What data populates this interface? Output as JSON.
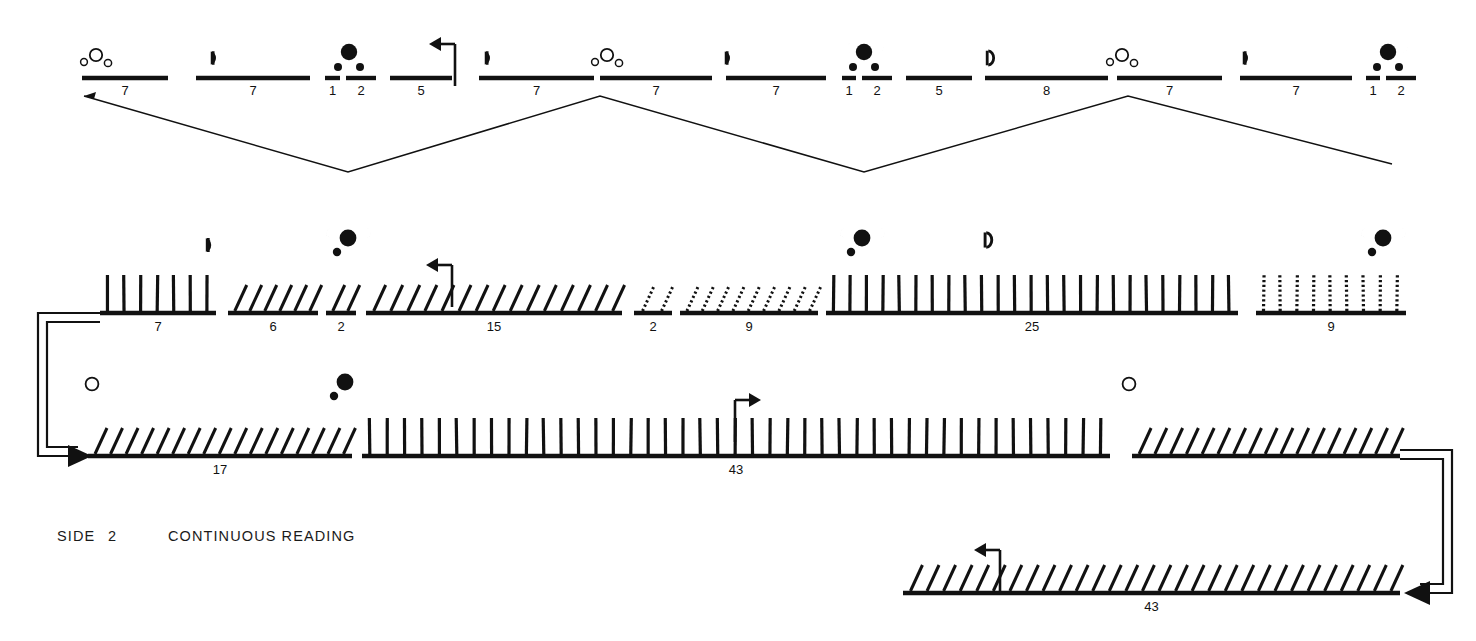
{
  "caption": {
    "side_label": "SIDE",
    "side_number": "2",
    "reading_label": "CONTINUOUS READING"
  },
  "colors": {
    "ink": "#111111",
    "paper": "#ffffff"
  },
  "glyph_legend": {
    "open_circle": "new-moon-open-circle",
    "filled_disc": "full-moon-filled-disc",
    "left_crescent": "waning-crescent",
    "right_crescent": "waxing-crescent",
    "half_left": "last-quarter-half-moon",
    "half_right": "first-quarter-half-moon",
    "flag_arrow": "turn-direction-marker"
  },
  "rows": [
    {
      "id": "row-1",
      "name": "top-segment-row",
      "style": "plain-bars",
      "y": 78,
      "segments": [
        {
          "count": "7",
          "x1": 82,
          "x2": 168
        },
        {
          "count": "7",
          "x1": 196,
          "x2": 310
        },
        {
          "count": "1",
          "x1": 325,
          "x2": 340
        },
        {
          "count": "2",
          "x1": 346,
          "x2": 376
        },
        {
          "count": "5",
          "x1": 390,
          "x2": 452
        },
        {
          "count": "7",
          "x1": 479,
          "x2": 594
        },
        {
          "count": "7",
          "x1": 600,
          "x2": 712
        },
        {
          "count": "7",
          "x1": 726,
          "x2": 826
        },
        {
          "count": "1",
          "x1": 842,
          "x2": 856
        },
        {
          "count": "2",
          "x1": 862,
          "x2": 892
        },
        {
          "count": "5",
          "x1": 906,
          "x2": 972
        },
        {
          "count": "8",
          "x1": 985,
          "x2": 1108
        },
        {
          "count": "7",
          "x1": 1117,
          "x2": 1222
        },
        {
          "count": "7",
          "x1": 1240,
          "x2": 1352
        },
        {
          "count": "1",
          "x1": 1366,
          "x2": 1380
        },
        {
          "count": "2",
          "x1": 1386,
          "x2": 1416
        }
      ],
      "markers": [
        {
          "type": "new-moon-cluster",
          "x": 96,
          "y": 58
        },
        {
          "type": "half-left",
          "x": 210,
          "y": 58
        },
        {
          "type": "full-moon-cluster",
          "x": 349,
          "y": 52
        },
        {
          "type": "flag-arrow-left",
          "x": 455,
          "y": 44
        },
        {
          "type": "half-left",
          "x": 484,
          "y": 58
        },
        {
          "type": "new-moon-cluster",
          "x": 607,
          "y": 58
        },
        {
          "type": "half-left",
          "x": 724,
          "y": 58
        },
        {
          "type": "full-moon-cluster",
          "x": 864,
          "y": 52
        },
        {
          "type": "half-right-D",
          "x": 990,
          "y": 58
        },
        {
          "type": "new-moon-cluster",
          "x": 1122,
          "y": 58
        },
        {
          "type": "half-left",
          "x": 1242,
          "y": 58
        },
        {
          "type": "full-moon-cluster",
          "x": 1388,
          "y": 52
        }
      ]
    },
    {
      "id": "row-2",
      "name": "middle-tally-row",
      "y": 313,
      "groups": [
        {
          "count": "7",
          "x1": 100,
          "x2": 216,
          "tick": "vertical",
          "n": 7
        },
        {
          "count": "6",
          "x1": 228,
          "x2": 318,
          "tick": "slant",
          "n": 6
        },
        {
          "count": "2",
          "x1": 326,
          "x2": 356,
          "tick": "slant",
          "n": 2
        },
        {
          "count": "15",
          "x1": 366,
          "x2": 622,
          "tick": "slant",
          "n": 15
        },
        {
          "count": "2",
          "x1": 634,
          "x2": 672,
          "tick": "slant-dotted",
          "n": 2
        },
        {
          "count": "9",
          "x1": 680,
          "x2": 818,
          "tick": "slant-dotted",
          "n": 9
        },
        {
          "count": "25",
          "x1": 826,
          "x2": 1238,
          "tick": "vertical",
          "n": 25
        },
        {
          "count": "9",
          "x1": 1256,
          "x2": 1406,
          "tick": "vertical-dotted",
          "n": 9
        }
      ],
      "markers": [
        {
          "type": "half-left",
          "x": 205,
          "y": 245
        },
        {
          "type": "full-moon-cluster",
          "x": 348,
          "y": 238
        },
        {
          "type": "flag-arrow-left",
          "x": 452,
          "y": 265
        },
        {
          "type": "full-moon-cluster",
          "x": 862,
          "y": 238
        },
        {
          "type": "half-right-D",
          "x": 988,
          "y": 240
        },
        {
          "type": "full-moon-cluster",
          "x": 1383,
          "y": 238
        }
      ]
    },
    {
      "id": "row-3",
      "name": "lower-tally-row",
      "y": 456,
      "groups": [
        {
          "count": "17",
          "x1": 88,
          "x2": 352,
          "tick": "slant",
          "n": 17
        },
        {
          "count": "43",
          "x1": 362,
          "x2": 1110,
          "tick": "vertical",
          "n": 43
        },
        {
          "count": "",
          "x1": 1132,
          "x2": 1400,
          "tick": "slant",
          "n": 17
        }
      ],
      "markers": [
        {
          "type": "open-circle",
          "x": 92,
          "y": 384
        },
        {
          "type": "full-moon-cluster",
          "x": 345,
          "y": 382
        },
        {
          "type": "flag-arrow-right",
          "x": 735,
          "y": 400
        },
        {
          "type": "open-circle",
          "x": 1129,
          "y": 384
        }
      ]
    },
    {
      "id": "row-4",
      "name": "bottom-tally-row",
      "y": 593,
      "groups": [
        {
          "count": "43",
          "x1": 903,
          "x2": 1400,
          "tick": "slant",
          "n": 30
        }
      ],
      "markers": [
        {
          "type": "right-crescent-small",
          "x": 903,
          "y": 533
        },
        {
          "type": "flag-arrow-left",
          "x": 1000,
          "y": 550
        }
      ]
    }
  ],
  "connectors": {
    "zigzag": {
      "name": "expansion-guide-lines",
      "points": "84,96 348,172 600,96 864,172 1128,96 1392,164"
    },
    "left_wrap": {
      "name": "wrap-left-bracket",
      "from_row": "row-2",
      "to_row": "row-3"
    },
    "right_wrap": {
      "name": "wrap-right-bracket",
      "from_row": "row-3",
      "to_row": "row-4"
    }
  }
}
